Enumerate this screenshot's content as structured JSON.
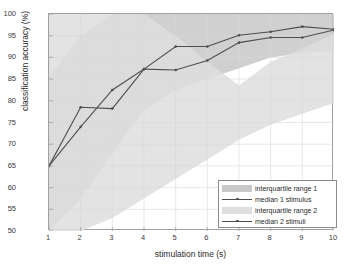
{
  "chart_data": {
    "type": "line",
    "title": "",
    "xlabel": "stimulation time (s)",
    "ylabel": "classification accuracy (%)",
    "xlim": [
      1,
      10
    ],
    "ylim": [
      50,
      100
    ],
    "xticks": [
      "1",
      "2",
      "3",
      "4",
      "5",
      "6",
      "7",
      "8",
      "9",
      "10"
    ],
    "yticks": [
      "50",
      "55",
      "60",
      "65",
      "70",
      "75",
      "80",
      "85",
      "90",
      "95",
      "100"
    ],
    "grid": true,
    "legend_position": "lower right",
    "x": [
      1,
      2,
      3,
      4,
      5,
      6,
      7,
      8,
      9,
      10
    ],
    "series": [
      {
        "name": "interquartile range 1",
        "kind": "band",
        "color": "#c8c8c8",
        "lower": [
          50.0,
          57.5,
          68.0,
          78.0,
          82.5,
          85.0,
          87.5,
          90.0,
          91.0,
          91.5
        ],
        "upper": [
          85.5,
          95.0,
          100.0,
          100.0,
          100.0,
          100.0,
          100.0,
          100.0,
          100.0,
          100.0
        ]
      },
      {
        "name": "median 1 stimulus",
        "kind": "line",
        "color": "#4d4d4d",
        "values": [
          65.0,
          78.5,
          78.2,
          87.3,
          92.5,
          92.5,
          95.1,
          95.9,
          97.1,
          96.5
        ]
      },
      {
        "name": "interquartile range 2",
        "kind": "band",
        "color": "#dedede",
        "lower": [
          50.0,
          50.0,
          53.0,
          57.5,
          62.0,
          66.5,
          71.0,
          74.5,
          77.0,
          79.5
        ],
        "upper": [
          100.0,
          100.0,
          100.0,
          100.0,
          95.0,
          89.0,
          83.5,
          89.0,
          92.0,
          95.5
        ]
      },
      {
        "name": "median 2 stimuli",
        "kind": "line",
        "color": "#4d4d4d",
        "values": [
          65.0,
          74.0,
          82.5,
          87.3,
          87.1,
          89.3,
          93.4,
          94.6,
          94.6,
          96.3
        ]
      }
    ]
  },
  "legend": {
    "entries": [
      {
        "label": "interquartile range 1",
        "type": "patch",
        "color": "#c8c8c8"
      },
      {
        "label": "median 1 stimulus",
        "type": "line",
        "color": "#4d4d4d"
      },
      {
        "label": "interquartile range 2",
        "type": "patch",
        "color": "#dedede"
      },
      {
        "label": "median 2 stimuli",
        "type": "line",
        "color": "#4d4d4d"
      }
    ]
  },
  "style": {
    "background": "#ffffff",
    "axis_color": "#a0a0a0",
    "grid_color": "#d9d9d9",
    "tick_text_color": "#3a3a3a"
  }
}
